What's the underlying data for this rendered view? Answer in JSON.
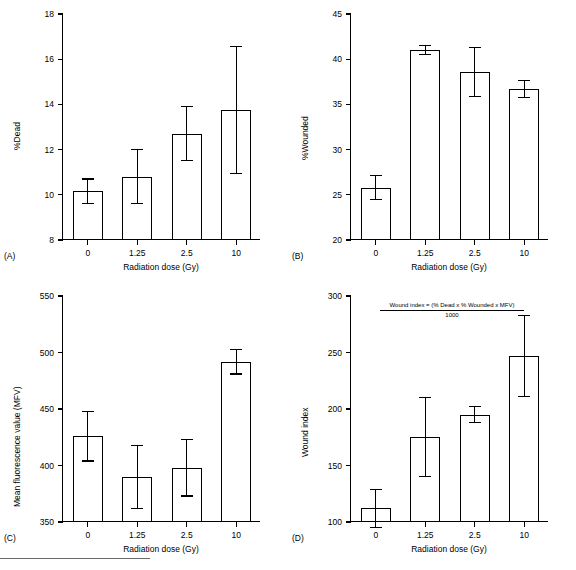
{
  "figure": {
    "panels": [
      "(A)",
      "(B)",
      "(C)",
      "(D)"
    ],
    "shared_xlabel": "Radiation dose (Gy)",
    "categories": [
      "0",
      "1.25",
      "2.5",
      "10"
    ]
  },
  "chart_data": [
    {
      "type": "bar",
      "panel": "(A)",
      "title": "",
      "xlabel": "Radiation dose (Gy)",
      "ylabel": "%Dead",
      "categories": [
        "0",
        "1.25",
        "2.5",
        "10"
      ],
      "values": [
        10.15,
        10.8,
        12.7,
        13.75
      ],
      "errors_upper": [
        0.55,
        1.2,
        1.2,
        2.8
      ],
      "errors_lower": [
        0.55,
        1.2,
        1.2,
        2.8
      ],
      "ylim": [
        8,
        18
      ],
      "yticks": [
        8,
        10,
        12,
        14,
        16,
        18
      ],
      "grid": false,
      "legend": "none"
    },
    {
      "type": "bar",
      "panel": "(B)",
      "title": "",
      "xlabel": "Radiation dose (Gy)",
      "ylabel": "%Wounded",
      "categories": [
        "0",
        "1.25",
        "2.5",
        "10"
      ],
      "values": [
        25.8,
        41.0,
        38.6,
        36.7
      ],
      "errors_upper": [
        1.3,
        0.5,
        2.7,
        0.9
      ],
      "errors_lower": [
        1.3,
        0.5,
        2.7,
        0.9
      ],
      "ylim": [
        20,
        45
      ],
      "yticks": [
        20,
        25,
        30,
        35,
        40,
        45
      ],
      "grid": false,
      "legend": "none"
    },
    {
      "type": "bar",
      "panel": "(C)",
      "title": "",
      "xlabel": "Radiation dose (Gy)",
      "ylabel": "Mean fluorescence value (MFV)",
      "categories": [
        "0",
        "1.25",
        "2.5",
        "10"
      ],
      "values": [
        426,
        390,
        398,
        492
      ],
      "errors_upper": [
        22,
        28,
        25,
        11
      ],
      "errors_lower": [
        22,
        28,
        25,
        11
      ],
      "ylim": [
        350,
        550
      ],
      "yticks": [
        350,
        400,
        450,
        500,
        550
      ],
      "grid": false,
      "legend": "none"
    },
    {
      "type": "bar",
      "panel": "(D)",
      "title": "",
      "xlabel": "Radiation dose (Gy)",
      "ylabel": "Wound index",
      "categories": [
        "0",
        "1.25",
        "2.5",
        "10"
      ],
      "values": [
        112,
        175,
        195,
        247
      ],
      "errors_upper": [
        17,
        35,
        7,
        36
      ],
      "errors_lower": [
        17,
        35,
        7,
        36
      ],
      "ylim": [
        100,
        300
      ],
      "yticks": [
        100,
        150,
        200,
        250,
        300
      ],
      "grid": false,
      "legend": "none",
      "annotation": {
        "numerator": "Wound index = (% Dead x % Wounded x MFV)",
        "denominator": "1000"
      }
    }
  ]
}
